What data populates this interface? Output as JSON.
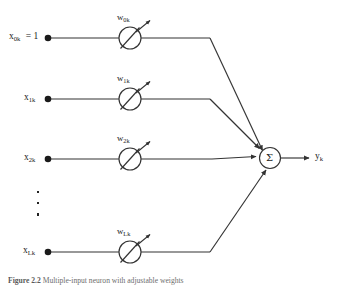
{
  "figure": {
    "caption_number": "Figure 2.2",
    "caption_text": "Multiple-input neuron with adjustable weights",
    "output_label": "y",
    "output_subscript": "k",
    "summation_symbol": "Σ",
    "ellipsis_symbol": "⋮",
    "line_color": "#333333",
    "node_fill": "#ffffff",
    "dot_color": "#1a1a1a"
  },
  "inputs": [
    {
      "name": "x",
      "subscript": "0k",
      "equals": "= 1",
      "has_value": true,
      "row_y": 38,
      "weight": "w",
      "weight_subscript": "0k"
    },
    {
      "name": "x",
      "subscript": "1k",
      "equals": "",
      "has_value": false,
      "row_y": 99,
      "weight": "w",
      "weight_subscript": "1k"
    },
    {
      "name": "x",
      "subscript": "2k",
      "equals": "",
      "has_value": false,
      "row_y": 159,
      "weight": "w",
      "weight_subscript": "2k"
    },
    {
      "name": "x",
      "subscript": "Lk",
      "equals": "",
      "has_value": false,
      "row_y": 252,
      "weight": "w",
      "weight_subscript": "Lk"
    }
  ]
}
